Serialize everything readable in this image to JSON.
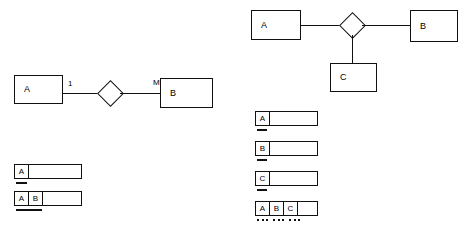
{
  "diagram": {
    "background_color": "#ffffff",
    "stroke_color": "#111111"
  },
  "binary": {
    "caption": "Binary 1:M relationship",
    "entities": [
      {
        "name": "entity-a",
        "label": "A"
      },
      {
        "name": "entity-b",
        "label": "B"
      }
    ],
    "relationship": {
      "name": "relationship-diamond",
      "label": ""
    },
    "cardinalities": [
      {
        "name": "cardinality-one",
        "label": "1"
      },
      {
        "name": "cardinality-many",
        "label": "M"
      }
    ],
    "relations": [
      {
        "name": "relation-a",
        "attributes": [
          "A"
        ],
        "key_span": 1,
        "key_style": "solid"
      },
      {
        "name": "relation-ab",
        "attributes": [
          "A",
          "B"
        ],
        "key_span": 2,
        "key_style": "solid"
      }
    ]
  },
  "ternary": {
    "caption": "Ternary relationship",
    "entities": [
      {
        "name": "entity-a",
        "label": "A"
      },
      {
        "name": "entity-b",
        "label": "B"
      },
      {
        "name": "entity-c",
        "label": "C"
      }
    ],
    "relationship": {
      "name": "relationship-diamond",
      "label": ""
    },
    "relations": [
      {
        "name": "relation-a",
        "attributes": [
          "A"
        ],
        "key_span": 1,
        "key_style": "solid"
      },
      {
        "name": "relation-b",
        "attributes": [
          "B"
        ],
        "key_span": 1,
        "key_style": "solid"
      },
      {
        "name": "relation-c",
        "attributes": [
          "C"
        ],
        "key_span": 1,
        "key_style": "solid"
      },
      {
        "name": "relation-abc",
        "attributes": [
          "A",
          "B",
          "C"
        ],
        "key_span": 3,
        "key_style": "dotted"
      }
    ]
  }
}
